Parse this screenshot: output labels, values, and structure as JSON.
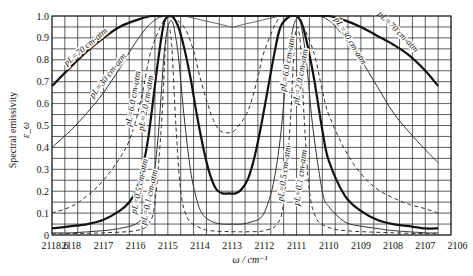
{
  "chart_data": {
    "type": "line",
    "title": "",
    "xlabel": "ω / cm⁻¹",
    "ylabel": "Spectral emissivity ε_ω",
    "ylabel_line1": "Spectral emissivity",
    "ylabel_line2": "ε_ω",
    "xlim": [
      2118.6,
      2106.2
    ],
    "ylim": [
      0,
      1.0
    ],
    "grid": true,
    "x_ticks": [
      "2118.6",
      "2118",
      "2117",
      "2116",
      "2115",
      "2114",
      "2113",
      "2112",
      "2111",
      "2110",
      "2109",
      "2108",
      "2107",
      "2106"
    ],
    "y_ticks": [
      "0",
      "0.1",
      "0.2",
      "0.3",
      "0.4",
      "0.5",
      "0.6",
      "0.7",
      "0.8",
      "0.9",
      "1.0"
    ],
    "series": [
      {
        "name": "pL=70 cm-atm",
        "style": "thick-solid",
        "x": [
          2118.6,
          2118,
          2117.5,
          2117,
          2116.5,
          2116,
          2115.5,
          2115,
          2113.5,
          2112,
          2110.5,
          2110,
          2109.5,
          2109,
          2108.5,
          2108,
          2107.5,
          2107,
          2106.6
        ],
        "y": [
          0.68,
          0.77,
          0.84,
          0.9,
          0.95,
          0.98,
          1.0,
          1.0,
          1.0,
          1.0,
          1.0,
          1.0,
          0.98,
          0.95,
          0.91,
          0.87,
          0.82,
          0.75,
          0.68
        ]
      },
      {
        "name": "pL=30 cm-atm",
        "style": "thin-solid",
        "x": [
          2118.6,
          2118,
          2117.5,
          2117,
          2116.5,
          2116,
          2115.5,
          2115,
          2113.5,
          2112,
          2110.5,
          2110,
          2109.5,
          2109,
          2108.5,
          2108,
          2107.5,
          2107,
          2106.6
        ],
        "y": [
          0.4,
          0.48,
          0.56,
          0.65,
          0.76,
          0.88,
          0.97,
          1.0,
          1.0,
          1.0,
          1.0,
          0.98,
          0.9,
          0.8,
          0.68,
          0.56,
          0.47,
          0.39,
          0.33
        ]
      },
      {
        "name": "pL=6.0 cm-atm",
        "style": "thin-solid-grey",
        "x": [
          2115.2,
          2115,
          2114.8,
          2114.5,
          2114.2,
          2113.9,
          2113.6,
          2113.3,
          2113.0,
          2112.7,
          2112.4,
          2112.1,
          2111.8,
          2111.5,
          2111.2,
          2110.9,
          2110.7
        ],
        "y": [
          1.0,
          1.0,
          1.0,
          1.0,
          0.99,
          0.98,
          0.97,
          0.96,
          0.95,
          0.96,
          0.97,
          0.98,
          0.99,
          1.0,
          1.0,
          1.0,
          1.0
        ]
      },
      {
        "name": "pL=2.0 cm-atm",
        "style": "dashed",
        "x": [
          2118.6,
          2118,
          2117.5,
          2117,
          2116.5,
          2116.2,
          2116,
          2115.8,
          2115.5,
          2115,
          2114.5,
          2114.2,
          2114,
          2113.7,
          2113.5,
          2113.3,
          2113,
          2112.8,
          2112.5,
          2112.2,
          2112,
          2111.5,
          2111,
          2110.5,
          2110.2,
          2110,
          2109.5,
          2109,
          2108.5,
          2108,
          2107.5,
          2107,
          2106.6
        ],
        "y": [
          0.1,
          0.13,
          0.18,
          0.25,
          0.35,
          0.43,
          0.52,
          0.64,
          0.85,
          1.0,
          0.95,
          0.84,
          0.72,
          0.57,
          0.5,
          0.47,
          0.47,
          0.5,
          0.57,
          0.72,
          0.84,
          1.0,
          1.0,
          0.85,
          0.66,
          0.55,
          0.39,
          0.28,
          0.21,
          0.17,
          0.14,
          0.12,
          0.1
        ]
      },
      {
        "name": "pL=0.5 cm-atm",
        "style": "thick-solid",
        "x": [
          2118.6,
          2118,
          2117.5,
          2117,
          2116.5,
          2116.2,
          2116,
          2115.8,
          2115.6,
          2115.3,
          2115.1,
          2114.9,
          2114.7,
          2114.5,
          2114.3,
          2114.1,
          2113.9,
          2113.7,
          2113.5,
          2113.3,
          2113.1,
          2112.9,
          2112.7,
          2112.5,
          2112.3,
          2112.1,
          2111.9,
          2111.7,
          2111.5,
          2111.2,
          2111,
          2110.8,
          2110.5,
          2110.2,
          2110,
          2109.5,
          2109,
          2108.5,
          2108,
          2107.5,
          2107,
          2106.6
        ],
        "y": [
          0.03,
          0.04,
          0.05,
          0.07,
          0.11,
          0.15,
          0.2,
          0.3,
          0.45,
          0.8,
          0.98,
          1.0,
          0.96,
          0.86,
          0.72,
          0.55,
          0.4,
          0.28,
          0.21,
          0.19,
          0.19,
          0.19,
          0.21,
          0.26,
          0.36,
          0.5,
          0.66,
          0.82,
          0.95,
          1.0,
          1.0,
          0.95,
          0.75,
          0.48,
          0.34,
          0.18,
          0.11,
          0.07,
          0.05,
          0.04,
          0.03,
          0.03
        ]
      },
      {
        "name": "pL=0.1 cm-atm",
        "style": "thin-solid",
        "x": [
          2118.6,
          2118,
          2117,
          2116.5,
          2116,
          2115.7,
          2115.5,
          2115.3,
          2115.1,
          2114.9,
          2114.7,
          2114.5,
          2114.3,
          2114.1,
          2113.9,
          2113.6,
          2113.3,
          2113,
          2112.7,
          2112.4,
          2112.1,
          2111.9,
          2111.7,
          2111.5,
          2111.3,
          2111.1,
          2110.9,
          2110.7,
          2110.5,
          2110.2,
          2110,
          2109.5,
          2109,
          2108.5,
          2108,
          2107,
          2106.6
        ],
        "y": [
          0.01,
          0.01,
          0.02,
          0.03,
          0.05,
          0.1,
          0.2,
          0.45,
          0.85,
          0.98,
          0.85,
          0.55,
          0.3,
          0.16,
          0.09,
          0.06,
          0.05,
          0.05,
          0.05,
          0.06,
          0.08,
          0.14,
          0.25,
          0.45,
          0.75,
          0.95,
          0.98,
          0.8,
          0.5,
          0.2,
          0.13,
          0.06,
          0.04,
          0.03,
          0.02,
          0.01,
          0.01
        ]
      },
      {
        "name": "pL=0.1 cm-atm (dashed, lower bound)",
        "style": "dashed",
        "x": [
          2118.6,
          2117,
          2116,
          2115.6,
          2115.4,
          2115.2,
          2115.05,
          2114.9,
          2114.75,
          2114.6,
          2114.4,
          2114.1,
          2113.7,
          2113,
          2112.4,
          2112,
          2111.6,
          2111.4,
          2111.2,
          2111.05,
          2110.9,
          2110.75,
          2110.6,
          2110.4,
          2110.1,
          2109.5,
          2108,
          2106.6
        ],
        "y": [
          0.005,
          0.01,
          0.02,
          0.05,
          0.15,
          0.5,
          0.9,
          0.9,
          0.5,
          0.2,
          0.08,
          0.04,
          0.02,
          0.015,
          0.015,
          0.02,
          0.05,
          0.15,
          0.5,
          0.9,
          0.9,
          0.5,
          0.2,
          0.08,
          0.04,
          0.02,
          0.01,
          0.005
        ]
      }
    ],
    "annotations": [
      {
        "text": "pL=70 cm-atm",
        "x": 2117.5,
        "y": 0.85
      },
      {
        "text": "pL=30 cm-atm",
        "x": 2116.8,
        "y": 0.72
      },
      {
        "text": "pL=6.0 cm-atm",
        "x": 2116.0,
        "y": 0.62
      },
      {
        "text": "pL=2.0 cm-atm",
        "x": 2115.6,
        "y": 0.6
      },
      {
        "text": "pL=0.5 cm-atm",
        "x": 2115.8,
        "y": 0.22
      },
      {
        "text": "pL=0.1 cm-atm",
        "x": 2115.5,
        "y": 0.17
      },
      {
        "text": "pL=6.0 cm-atm",
        "x": 2111.2,
        "y": 0.78
      },
      {
        "text": "pL=2.0 cm-atm",
        "x": 2110.8,
        "y": 0.72
      },
      {
        "text": "pL=0.5 cm-atm",
        "x": 2111.3,
        "y": 0.28
      },
      {
        "text": "pL=0.1 cm-atm",
        "x": 2110.8,
        "y": 0.26
      },
      {
        "text": "pL=30 cm-atm",
        "x": 2109.4,
        "y": 0.88
      },
      {
        "text": "pL=70 cm-atm",
        "x": 2107.9,
        "y": 0.92
      }
    ]
  }
}
